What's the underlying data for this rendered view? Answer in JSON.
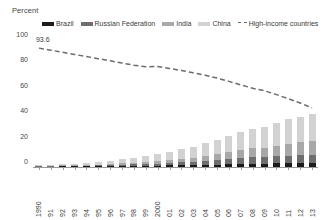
{
  "chart": {
    "axis_title": "Percent",
    "ylabel": "Percent",
    "xlabel": ""
  },
  "legend": {
    "position": "top",
    "items": [
      {
        "label": "Brazil",
        "color": "#1a1a1a",
        "type": "bar"
      },
      {
        "label": "Russian Federation",
        "color": "#6e6e6e",
        "type": "bar"
      },
      {
        "label": "India",
        "color": "#a8a8a8",
        "type": "bar"
      },
      {
        "label": "China",
        "color": "#d2d2d2",
        "type": "bar"
      },
      {
        "label": "High-income countries",
        "color": "#6b6b6b",
        "type": "dashed-line"
      }
    ]
  },
  "annotations": [
    {
      "name": "first-point-label",
      "text": "93.6",
      "value": 93.6
    }
  ],
  "yticks": [
    "0",
    "20",
    "40",
    "60",
    "80",
    "100"
  ],
  "chart_data": {
    "type": "bar",
    "stacked": true,
    "title": "",
    "subtitle": "",
    "xlabel": "",
    "ylabel": "Percent",
    "ylim": [
      0,
      100
    ],
    "yticks": [
      0,
      20,
      40,
      60,
      80,
      100
    ],
    "grid": false,
    "legend_position": "top",
    "categories": [
      "1990",
      "91",
      "92",
      "93",
      "94",
      "95",
      "96",
      "97",
      "98",
      "99",
      "2000",
      "01",
      "02",
      "03",
      "04",
      "05",
      "06",
      "07",
      "08",
      "09",
      "10",
      "11",
      "12",
      "13"
    ],
    "series": [
      {
        "name": "Brazil",
        "type": "bar",
        "color": "#1a1a1a",
        "values": [
          0.4,
          0.4,
          0.5,
          0.5,
          0.6,
          0.7,
          0.8,
          0.9,
          1.0,
          1.0,
          1.1,
          1.2,
          1.3,
          1.4,
          1.6,
          1.8,
          2.0,
          2.2,
          2.4,
          2.5,
          2.8,
          3.0,
          3.1,
          3.2
        ]
      },
      {
        "name": "Russian Federation",
        "type": "bar",
        "color": "#6e6e6e",
        "values": [
          0.3,
          0.3,
          0.4,
          0.4,
          0.5,
          0.6,
          0.7,
          0.9,
          1.1,
          1.3,
          1.6,
          1.9,
          2.3,
          2.7,
          3.2,
          3.7,
          4.3,
          4.9,
          5.4,
          5.0,
          5.6,
          6.0,
          6.3,
          6.5
        ]
      },
      {
        "name": "India",
        "type": "bar",
        "color": "#a8a8a8",
        "values": [
          0.3,
          0.4,
          0.4,
          0.5,
          0.6,
          0.7,
          0.9,
          1.1,
          1.3,
          1.6,
          1.9,
          2.2,
          2.6,
          3.1,
          3.7,
          4.4,
          5.2,
          6.0,
          6.8,
          7.4,
          8.5,
          9.3,
          10.0,
          10.6
        ]
      },
      {
        "name": "China",
        "type": "bar",
        "color": "#d2d2d2",
        "values": [
          0.6,
          0.8,
          1.0,
          1.3,
          1.7,
          2.1,
          2.6,
          3.2,
          3.9,
          4.7,
          5.6,
          6.6,
          7.7,
          8.9,
          10.2,
          11.5,
          12.8,
          14.1,
          15.3,
          16.4,
          17.8,
          19.2,
          20.3,
          21.1
        ]
      },
      {
        "name": "High-income countries",
        "type": "line",
        "style": "dashed",
        "color": "#6b6b6b",
        "values": [
          93.6,
          92.0,
          90.3,
          88.6,
          87.0,
          85.3,
          83.6,
          81.8,
          80.2,
          78.9,
          79.2,
          77.6,
          76.0,
          74.2,
          72.3,
          70.0,
          67.4,
          64.7,
          62.0,
          60.0,
          57.0,
          53.8,
          50.4,
          46.6
        ]
      }
    ]
  }
}
